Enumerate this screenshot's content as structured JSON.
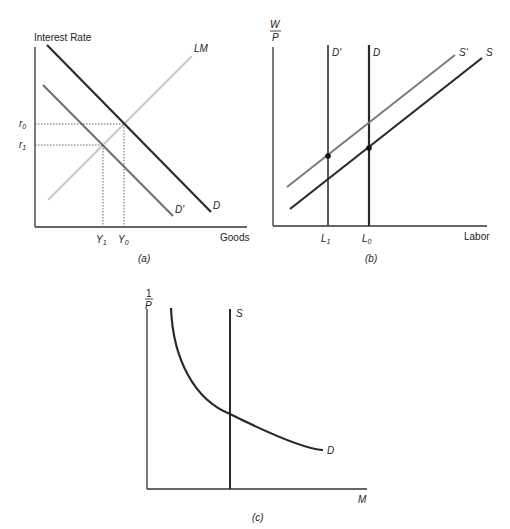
{
  "panels": {
    "a": {
      "caption": "(a)",
      "y_axis_label": "Interest Rate",
      "x_axis_label": "Goods",
      "curves": {
        "LM": "LM",
        "D": "D",
        "D_prime": "D'"
      },
      "y_ticks": {
        "r0": "r",
        "r0_sub": "0",
        "r1": "r",
        "r1_sub": "1"
      },
      "x_ticks": {
        "Y1": "Y",
        "Y1_sub": "1",
        "Y0": "Y",
        "Y0_sub": "0"
      }
    },
    "b": {
      "caption": "(b)",
      "y_axis_label_num": "W",
      "y_axis_label_den": "P",
      "x_axis_label": "Labor",
      "curves": {
        "D": "D",
        "D_prime": "D'",
        "S": "S",
        "S_prime": "S'"
      },
      "x_ticks": {
        "L1": "L",
        "L1_sub": "1",
        "L0": "L",
        "L0_sub": "0"
      }
    },
    "c": {
      "caption": "(c)",
      "y_axis_label_num": "1",
      "y_axis_label_den": "P",
      "x_axis_label": "M",
      "curves": {
        "S": "S",
        "D": "D"
      }
    }
  },
  "colors": {
    "axis": "#333333",
    "dark_curve": "#2a2a2a",
    "mid_curve": "#6e6e6e",
    "light_curve": "#c8c8c8",
    "dotted": "#555555"
  }
}
